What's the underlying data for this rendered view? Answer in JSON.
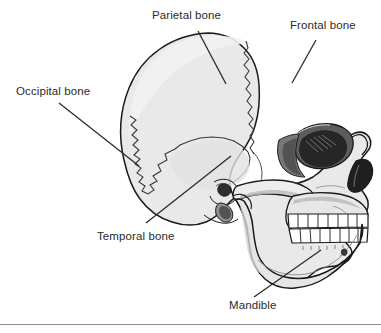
{
  "figure": {
    "background_color": "#ffffff",
    "rule_color": "#8d8d8d",
    "palette": {
      "bone_fill": "#e9e9e9",
      "bone_fill_light": "#f2f2f2",
      "outline": "#1a1a1a",
      "suture": "#3a3a3a",
      "shadow_mid": "#9a9a9a",
      "shadow_dark": "#4a4a4a",
      "cavity_dark": "#262626",
      "tooth_white": "#ffffff",
      "label_text": "#2b2b2b"
    }
  },
  "labels": [
    {
      "id": "parietal",
      "text": "Parietal bone",
      "leader": {
        "x1": 198,
        "y1": 31,
        "x2": 226,
        "y2": 84
      }
    },
    {
      "id": "frontal",
      "text": "Frontal bone",
      "leader": {
        "x1": 316,
        "y1": 40,
        "x2": 292,
        "y2": 83
      }
    },
    {
      "id": "occipital",
      "text": "Occipital bone",
      "leader": {
        "x1": 59,
        "y1": 103,
        "x2": 139,
        "y2": 166
      }
    },
    {
      "id": "temporal",
      "text": "Temporal bone",
      "leader": {
        "x1": 146,
        "y1": 223,
        "x2": 231,
        "y2": 156
      }
    },
    {
      "id": "mandible",
      "text": "Mandible",
      "leader": {
        "x1": 254,
        "y1": 297,
        "x2": 321,
        "y2": 250
      }
    }
  ],
  "anatomy": {
    "orientation": "lateral profile, facing right",
    "parts": [
      "cranial vault",
      "coronal suture",
      "squamous suture",
      "occipital suture",
      "external auditory meatus",
      "mastoid process",
      "zygomatic arch",
      "orbit",
      "nasal aperture",
      "maxilla",
      "upper teeth",
      "lower teeth",
      "mandible ramus",
      "mandible body",
      "mental protuberance"
    ]
  }
}
